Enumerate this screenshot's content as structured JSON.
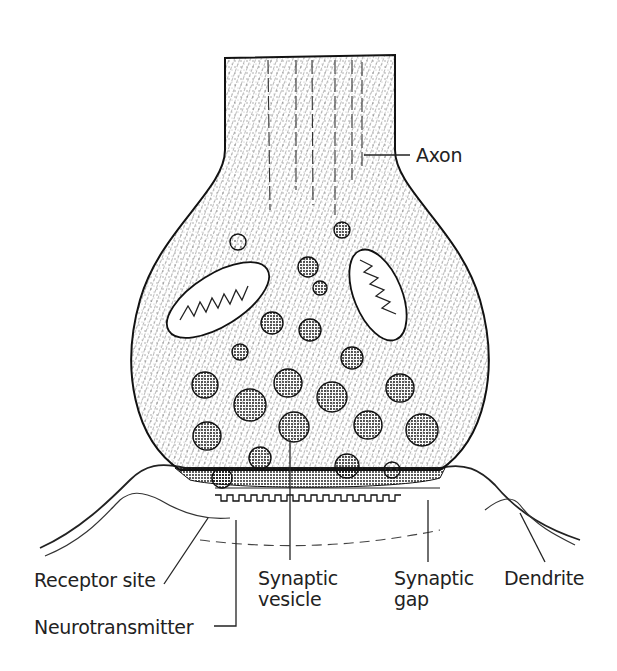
{
  "figure": {
    "labels": {
      "axon": "Axon",
      "receptor_site": "Receptor site",
      "neurotransmitter": "Neurotransmitter",
      "synaptic_vesicle_line1": "Synaptic",
      "synaptic_vesicle_line2": "vesicle",
      "synaptic_gap_line1": "Synaptic",
      "synaptic_gap_line2": "gap",
      "dendrite": "Dendrite"
    }
  }
}
